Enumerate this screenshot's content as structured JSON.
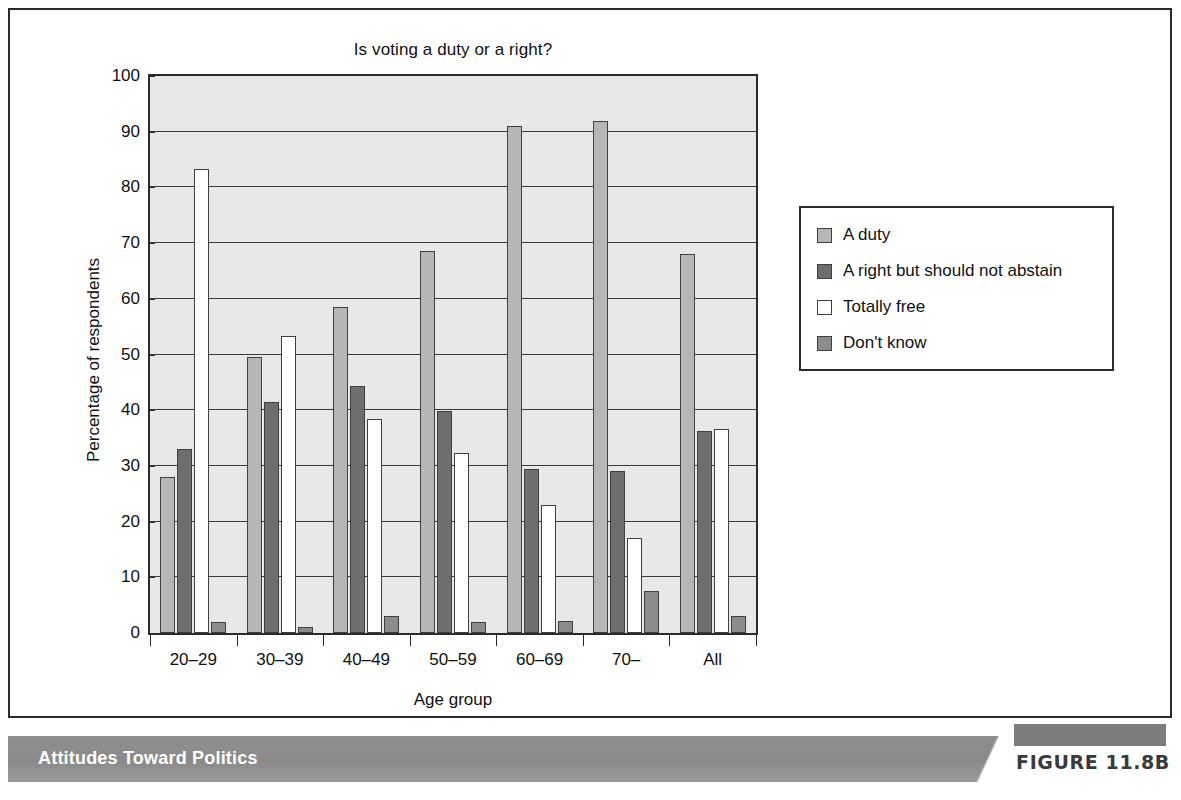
{
  "figure": {
    "caption": "Attitudes Toward Politics",
    "tag": "FIGURE 11.8B"
  },
  "chart_data": {
    "type": "bar",
    "title": "Is voting a duty or a right?",
    "xlabel": "Age group",
    "ylabel": "Percentage of respondents",
    "ylim": [
      0,
      100
    ],
    "yticks": [
      0,
      10,
      20,
      30,
      40,
      50,
      60,
      70,
      80,
      90,
      100
    ],
    "grid": true,
    "legend_position": "right",
    "categories": [
      "20–29",
      "30–39",
      "40–49",
      "50–59",
      "60–69",
      "70–",
      "All"
    ],
    "series": [
      {
        "name": "A duty",
        "color": "#b6b6b6",
        "values": [
          28,
          49.5,
          58.5,
          68.5,
          91,
          92,
          68
        ]
      },
      {
        "name": "A right but should not abstain",
        "color": "#6e6e6e",
        "values": [
          33,
          41.5,
          44.3,
          39.8,
          29.5,
          29,
          36.2
        ]
      },
      {
        "name": "Totally free",
        "color": "#ffffff",
        "values": [
          83.3,
          53.3,
          38.5,
          32.3,
          23,
          17,
          36.7
        ]
      },
      {
        "name": "Don't know",
        "color": "#8c8c8c",
        "values": [
          2,
          1,
          3,
          2,
          2.2,
          7.5,
          3
        ]
      }
    ]
  }
}
